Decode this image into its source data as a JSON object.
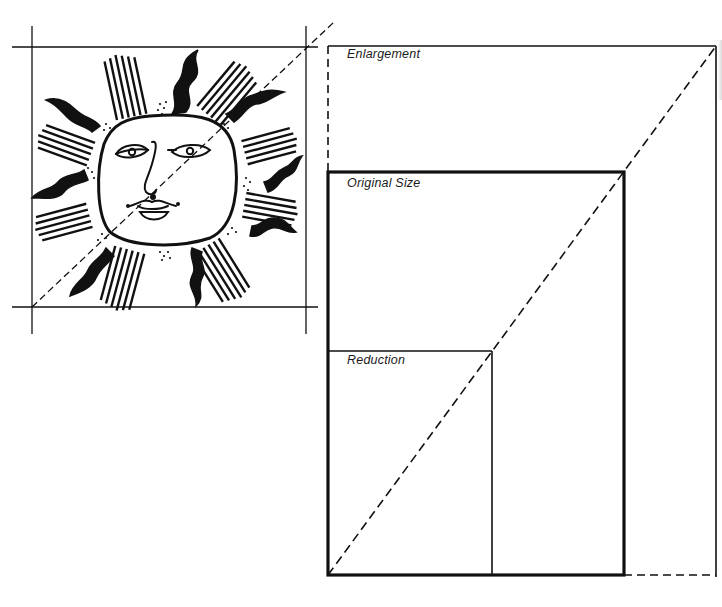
{
  "diagram": {
    "colors": {
      "ink": "#111111",
      "background": "#ffffff"
    },
    "labels": {
      "enlargement": "Enlargement",
      "original_size": "Original Size",
      "reduction": "Reduction"
    },
    "artwork": {
      "subject": "sun-face-illustration",
      "crop_box": {
        "left": 32,
        "top": 47,
        "right": 306,
        "bottom": 307
      }
    },
    "rectangles": {
      "enlargement": {
        "left": 328,
        "top": 46,
        "right": 716,
        "bottom": 575,
        "style": "thin, dashed where outside original"
      },
      "original_size": {
        "left": 328,
        "top": 172,
        "right": 624,
        "bottom": 575,
        "style": "thick solid"
      },
      "reduction": {
        "left": 328,
        "top": 351,
        "right": 492,
        "bottom": 575,
        "style": "thin solid"
      }
    },
    "diagonal": {
      "from": [
        328,
        575
      ],
      "to": [
        716,
        46
      ],
      "style": "dashed"
    }
  }
}
